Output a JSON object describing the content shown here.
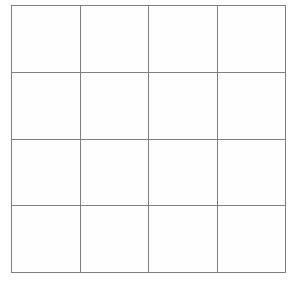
{
  "figure": {
    "name": "grid",
    "rows": 4,
    "columns": 4,
    "line_color": "#7f7f7f",
    "line_width_px": 3,
    "cell_fill_color": "#fefefe",
    "background_color": "#ffffff",
    "cells": [
      [
        "",
        "",
        "",
        ""
      ],
      [
        "",
        "",
        "",
        ""
      ],
      [
        "",
        "",
        "",
        ""
      ],
      [
        "",
        "",
        "",
        ""
      ]
    ]
  },
  "chart_data": {
    "type": "table",
    "title": "",
    "xlabel": "",
    "ylabel": "",
    "rows": 4,
    "columns": 4,
    "grid": true,
    "legend": "none",
    "headers": [
      "",
      "",
      "",
      ""
    ],
    "values": [
      [
        "",
        "",
        "",
        ""
      ],
      [
        "",
        "",
        "",
        ""
      ],
      [
        "",
        "",
        "",
        ""
      ],
      [
        "",
        "",
        "",
        ""
      ]
    ]
  }
}
